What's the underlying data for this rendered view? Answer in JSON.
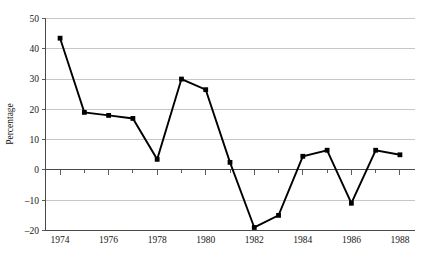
{
  "chart_data": {
    "type": "line",
    "title": "",
    "xlabel": "",
    "ylabel": "Percentage",
    "x": [
      1974,
      1975,
      1976,
      1977,
      1978,
      1979,
      1980,
      1981,
      1982,
      1983,
      1984,
      1985,
      1986,
      1987,
      1988
    ],
    "values": [
      43.5,
      19.0,
      18.0,
      17.0,
      3.5,
      30.0,
      26.5,
      2.5,
      -19.0,
      -15.0,
      4.5,
      6.5,
      -11.0,
      6.5,
      5.0
    ],
    "series": [
      {
        "name": "Percentage",
        "values": [
          43.5,
          19.0,
          18.0,
          17.0,
          3.5,
          30.0,
          26.5,
          2.5,
          -19.0,
          -15.0,
          4.5,
          6.5,
          -11.0,
          6.5,
          5.0
        ]
      }
    ],
    "xlim": [
      1973.4,
      1988.6
    ],
    "ylim": [
      -20,
      50
    ],
    "y_ticks": [
      50,
      40,
      30,
      20,
      10,
      0,
      -10,
      -20
    ],
    "y_tick_labels": [
      "50",
      "40",
      "30",
      "20",
      "10",
      "0",
      "–10",
      "–20"
    ],
    "x_ticks": [
      1974,
      1975,
      1976,
      1977,
      1978,
      1979,
      1980,
      1981,
      1982,
      1983,
      1984,
      1985,
      1986,
      1987,
      1988
    ],
    "x_tick_labels": [
      "1974",
      "",
      "1976",
      "",
      "1978",
      "",
      "1980",
      "",
      "1982",
      "",
      "1984",
      "",
      "1986",
      "",
      "1988"
    ],
    "x_major_ticks": [
      1974,
      1976,
      1978,
      1980,
      1982,
      1984,
      1986,
      1988
    ],
    "grid": "horizontal",
    "legend": "none",
    "marker": "square",
    "line_color": "#000000",
    "marker_color": "#000000",
    "gridline_color": "#b9b9b9",
    "axis_color": "#4a4a4a",
    "background_color": "#ffffff"
  }
}
